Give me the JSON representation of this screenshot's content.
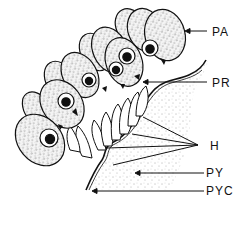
{
  "diagram": {
    "type": "biological-illustration",
    "labels": [
      {
        "id": "PA",
        "text": "PA",
        "x": 212,
        "y": 26
      },
      {
        "id": "PR",
        "text": "PR",
        "x": 212,
        "y": 77
      },
      {
        "id": "H",
        "text": "H",
        "x": 210,
        "y": 140
      },
      {
        "id": "PY",
        "text": "PY",
        "x": 206,
        "y": 167
      },
      {
        "id": "PYC",
        "text": "PYC",
        "x": 206,
        "y": 185
      }
    ],
    "colors": {
      "ink": "#111111",
      "background": "#ffffff",
      "stipple": "#333333"
    }
  }
}
